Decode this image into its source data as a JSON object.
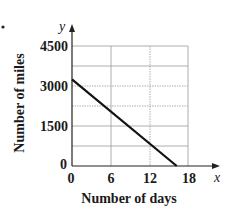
{
  "chart_data": {
    "type": "line",
    "title": "",
    "xlabel": "Number of days",
    "ylabel": "Number of miles",
    "x_axis_variable": "x",
    "y_axis_variable": "y",
    "xlim": [
      0,
      18
    ],
    "ylim": [
      0,
      4500
    ],
    "x_ticks": [
      "0",
      "6",
      "12",
      "18"
    ],
    "y_ticks": [
      "0",
      "1500",
      "3000",
      "4500"
    ],
    "grid": true,
    "series": [
      {
        "name": "miles remaining",
        "x": [
          0,
          16.25
        ],
        "y": [
          3250,
          0
        ]
      }
    ],
    "colors": {
      "line": "#111111",
      "axis": "#222222",
      "grid": "#9a9a9a"
    }
  }
}
